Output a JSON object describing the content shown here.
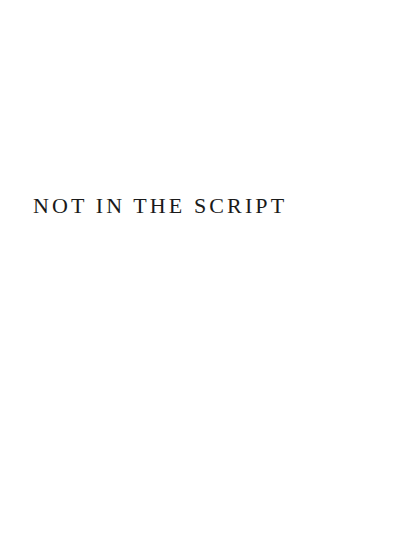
{
  "page": {
    "title": "NOT IN THE SCRIPT",
    "background_color": "#ffffff",
    "text_color": "#1a1a1a"
  }
}
